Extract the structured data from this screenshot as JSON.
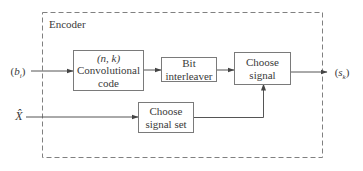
{
  "diagram": {
    "type": "block-diagram",
    "encoder": {
      "label": "Encoder"
    },
    "inputs": {
      "bits": {
        "label_open": "(",
        "symbol": "b",
        "subscript": "i",
        "label_close": ")"
      },
      "xhat": {
        "symbol": "X̂"
      }
    },
    "output": {
      "label_open": "(",
      "symbol": "s",
      "subscript": "k",
      "label_close": ")"
    },
    "blocks": {
      "conv_code": {
        "line1": "(n, k)",
        "line2": "Convolutional",
        "line3": "code"
      },
      "interleaver": {
        "line1": "Bit",
        "line2": "interleaver"
      },
      "choose_signal": {
        "line1": "Choose",
        "line2": "signal"
      },
      "choose_signal_set": {
        "line1": "Choose",
        "line2": "signal set"
      }
    },
    "connections": [
      {
        "from": "(b_i)",
        "to": "(n, k) Convolutional code"
      },
      {
        "from": "(n, k) Convolutional code",
        "to": "Bit interleaver"
      },
      {
        "from": "Bit interleaver",
        "to": "Choose signal"
      },
      {
        "from": "X̂",
        "to": "Choose signal set"
      },
      {
        "from": "Choose signal set",
        "to": "Choose signal"
      },
      {
        "from": "Choose signal",
        "to": "(s_k)"
      }
    ],
    "colors": {
      "line": "#6f6f6f",
      "dashed_border": "#808080",
      "text": "#3a3a3a"
    }
  }
}
